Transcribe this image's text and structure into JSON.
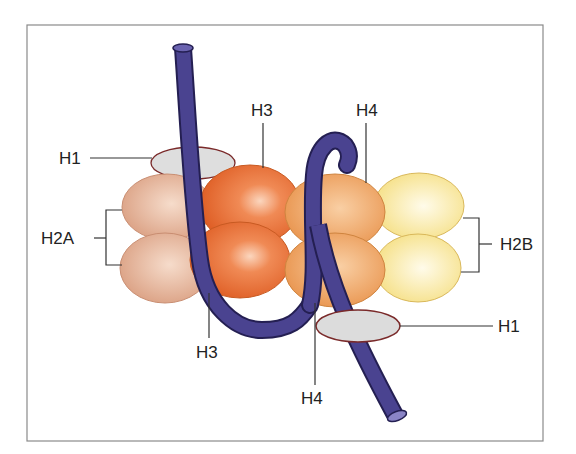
{
  "diagram": {
    "labels": {
      "h1_top": "H1",
      "h3_top": "H3",
      "h4_top": "H4",
      "h2a": "H2A",
      "h2b": "H2B",
      "h3_bottom": "H3",
      "h1_bottom": "H1",
      "h4_bottom": "H4"
    },
    "colors": {
      "dna": "#3d3579",
      "h2a": "#e8b394",
      "h3": "#e8743a",
      "h4": "#eea35e",
      "h2b": "#f8e79a",
      "h1": "#dcdcdc",
      "h1_outline": "#7a2a2a",
      "frame": "#888888"
    }
  }
}
